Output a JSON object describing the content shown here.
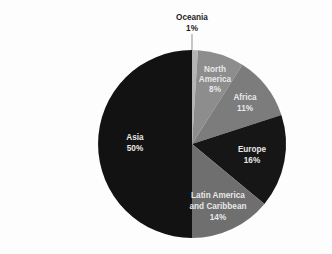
{
  "chart_data": {
    "type": "pie",
    "title": "",
    "subtitle": "",
    "xlabel": "",
    "ylabel": "",
    "legend_position": "none",
    "grid": false,
    "value_unit": "percent",
    "start_angle_deg": 0,
    "direction": "clockwise",
    "categories": [
      "Oceania",
      "North America",
      "Africa",
      "Europe",
      "Latin America and Caribbean",
      "Asia"
    ],
    "values": [
      1,
      8,
      11,
      16,
      14,
      50
    ],
    "slices": [
      {
        "label": "Oceania",
        "label_line1": "Oceania",
        "label_line2": "",
        "value": 1,
        "value_text": "1%",
        "color": "#b4b4b4",
        "text_color": "#1d1d1d",
        "label_placement": "outside-top",
        "label_x": 192,
        "label_y": 18,
        "value_x": 192,
        "value_y": 29,
        "leader_x1": 192,
        "leader_y1": 34,
        "leader_x2": 192,
        "leader_y2": 50
      },
      {
        "label": "North America",
        "label_line1": "North",
        "label_line2": "America",
        "value": 8,
        "value_text": "8%",
        "color": "#8d8d8d",
        "text_color": "#e8e8e8",
        "label_placement": "inside",
        "label_x": 215,
        "label_y": 70,
        "label2_x": 215,
        "label2_y": 80,
        "value_x": 215,
        "value_y": 90
      },
      {
        "label": "Africa",
        "label_line1": "Africa",
        "label_line2": "",
        "value": 11,
        "value_text": "11%",
        "color": "#7c7c7c",
        "text_color": "#e8e8e8",
        "label_placement": "inside",
        "label_x": 245,
        "label_y": 98,
        "value_x": 245,
        "value_y": 109
      },
      {
        "label": "Europe",
        "label_line1": "Europe",
        "label_line2": "",
        "value": 16,
        "value_text": "16%",
        "color": "#161616",
        "text_color": "#e8e8e8",
        "label_placement": "inside",
        "label_x": 252,
        "label_y": 150,
        "value_x": 252,
        "value_y": 161
      },
      {
        "label": "Latin America and Caribbean",
        "label_line1": "Latin America",
        "label_line2": "and Caribbean",
        "value": 14,
        "value_text": "14%",
        "color": "#6f6f6f",
        "text_color": "#e8e8e8",
        "label_placement": "inside",
        "label_x": 218,
        "label_y": 196,
        "label2_x": 218,
        "label2_y": 207,
        "value_x": 218,
        "value_y": 218
      },
      {
        "label": "Asia",
        "label_line1": "Asia",
        "label_line2": "",
        "value": 50,
        "value_text": "50%",
        "color": "#121212",
        "text_color": "#e8e8e8",
        "label_placement": "inside",
        "label_x": 135,
        "label_y": 138,
        "value_x": 135,
        "value_y": 149
      }
    ],
    "geometry": {
      "center_x": 192,
      "center_y": 144,
      "radius": 94
    },
    "background_color": "#fdfdfd"
  }
}
